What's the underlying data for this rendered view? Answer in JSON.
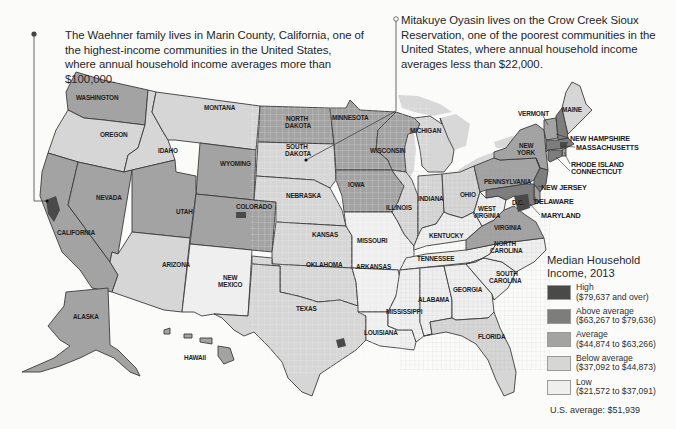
{
  "callouts": {
    "left": {
      "text": "The Waehner family lives in Marin County, California, one of the highest-income communities in the United States, where annual household income averages more than $100,000.",
      "marker": "filled-dot",
      "location": "Marin County, California"
    },
    "right": {
      "text": "Mitakuye Oyasin lives on the Crow Creek Sioux Reservation, one of the poorest communities in the United States, where annual household income averages less than $22,000.",
      "marker": "hollow-dot",
      "location": "Crow Creek Sioux Reservation, South Dakota"
    }
  },
  "legend": {
    "title": "Median Household Income, 2013",
    "items": [
      {
        "level": "high",
        "label": "High",
        "range": "($79,637 and over)",
        "color": "#4a4a4a"
      },
      {
        "level": "above",
        "label": "Above average",
        "range": "($63,267 to $79,636)",
        "color": "#7d7d7d"
      },
      {
        "level": "average",
        "label": "Average",
        "range": "($44,874 to $63,266)",
        "color": "#a3a3a3"
      },
      {
        "level": "below",
        "label": "Below average",
        "range": "($37,092 to $44,873)",
        "color": "#d6d6d6"
      },
      {
        "level": "low",
        "label": "Low",
        "range": "($21,572 to $37,091)",
        "color": "#efefef"
      }
    ],
    "us_average": "U.S. average: $51,939"
  },
  "map": {
    "title": "Median Household Income, 2013",
    "border_color": "#3a3a3a",
    "water_color": "#d9d9d9",
    "states": [
      {
        "name": "WASHINGTON",
        "level": "average"
      },
      {
        "name": "OREGON",
        "level": "below"
      },
      {
        "name": "CALIFORNIA",
        "level": "average"
      },
      {
        "name": "IDAHO",
        "level": "below"
      },
      {
        "name": "NEVADA",
        "level": "average"
      },
      {
        "name": "MONTANA",
        "level": "below"
      },
      {
        "name": "WYOMING",
        "level": "average"
      },
      {
        "name": "UTAH",
        "level": "average"
      },
      {
        "name": "ARIZONA",
        "level": "below"
      },
      {
        "name": "COLORADO",
        "level": "average"
      },
      {
        "name": "NEW MEXICO",
        "level": "low"
      },
      {
        "name": "NORTH DAKOTA",
        "level": "average"
      },
      {
        "name": "SOUTH DAKOTA",
        "level": "below"
      },
      {
        "name": "NEBRASKA",
        "level": "below"
      },
      {
        "name": "KANSAS",
        "level": "below"
      },
      {
        "name": "OKLAHOMA",
        "level": "below"
      },
      {
        "name": "TEXAS",
        "level": "below"
      },
      {
        "name": "MINNESOTA",
        "level": "average"
      },
      {
        "name": "IOWA",
        "level": "average"
      },
      {
        "name": "MISSOURI",
        "level": "low"
      },
      {
        "name": "ARKANSAS",
        "level": "low"
      },
      {
        "name": "LOUISIANA",
        "level": "low"
      },
      {
        "name": "WISCONSIN",
        "level": "average"
      },
      {
        "name": "ILLINOIS",
        "level": "below"
      },
      {
        "name": "MICHIGAN",
        "level": "below"
      },
      {
        "name": "INDIANA",
        "level": "below"
      },
      {
        "name": "OHIO",
        "level": "below"
      },
      {
        "name": "KENTUCKY",
        "level": "low"
      },
      {
        "name": "TENNESSEE",
        "level": "low"
      },
      {
        "name": "MISSISSIPPI",
        "level": "low"
      },
      {
        "name": "ALABAMA",
        "level": "low"
      },
      {
        "name": "GEORGIA",
        "level": "low"
      },
      {
        "name": "FLORIDA",
        "level": "below"
      },
      {
        "name": "SOUTH CAROLINA",
        "level": "low"
      },
      {
        "name": "NORTH CAROLINA",
        "level": "low"
      },
      {
        "name": "VIRGINIA",
        "level": "average"
      },
      {
        "name": "WEST VIRGINIA",
        "level": "low"
      },
      {
        "name": "PENNSYLVANIA",
        "level": "average"
      },
      {
        "name": "NEW YORK",
        "level": "average"
      },
      {
        "name": "VERMONT",
        "level": "average"
      },
      {
        "name": "MAINE",
        "level": "below"
      },
      {
        "name": "NEW HAMPSHIRE",
        "level": "above"
      },
      {
        "name": "MASSACHUSETTS",
        "level": "above"
      },
      {
        "name": "RHODE ISLAND",
        "level": "average"
      },
      {
        "name": "CONNECTICUT",
        "level": "above"
      },
      {
        "name": "NEW JERSEY",
        "level": "above"
      },
      {
        "name": "DELAWARE",
        "level": "average"
      },
      {
        "name": "MARYLAND",
        "level": "above"
      },
      {
        "name": "ALASKA",
        "level": "average"
      },
      {
        "name": "HAWAII",
        "level": "average"
      }
    ],
    "labels": {
      "WASHINGTON": "WASHINGTON",
      "OREGON": "OREGON",
      "CALIFORNIA": "CALIFORNIA",
      "IDAHO": "IDAHO",
      "NEVADA": "NEVADA",
      "MONTANA": "MONTANA",
      "WYOMING": "WYOMING",
      "UTAH": "UTAH",
      "ARIZONA": "ARIZONA",
      "COLORADO": "COLORADO",
      "NEW_MEXICO_1": "NEW",
      "NEW_MEXICO_2": "MEXICO",
      "NORTH_DAKOTA_1": "NORTH",
      "NORTH_DAKOTA_2": "DAKOTA",
      "SOUTH_DAKOTA_1": "SOUTH",
      "SOUTH_DAKOTA_2": "DAKOTA",
      "NEBRASKA": "NEBRASKA",
      "KANSAS": "KANSAS",
      "OKLAHOMA": "OKLAHOMA",
      "TEXAS": "TEXAS",
      "MINNESOTA": "MINNESOTA",
      "IOWA": "IOWA",
      "MISSOURI": "MISSOURI",
      "ARKANSAS": "ARKANSAS",
      "LOUISIANA": "LOUISIANA",
      "WISCONSIN": "WISCONSIN",
      "ILLINOIS": "ILLINOIS",
      "MICHIGAN": "MICHIGAN",
      "INDIANA": "INDIANA",
      "OHIO": "OHIO",
      "KENTUCKY": "KENTUCKY",
      "TENNESSEE": "TENNESSEE",
      "MISSISSIPPI": "MISSISSIPPI",
      "ALABAMA": "ALABAMA",
      "GEORGIA": "GEORGIA",
      "FLORIDA": "FLORIDA",
      "SOUTH_CAROLINA_1": "SOUTH",
      "SOUTH_CAROLINA_2": "CAROLINA",
      "NORTH_CAROLINA_1": "NORTH",
      "NORTH_CAROLINA_2": "CAROLINA",
      "VIRGINIA": "VIRGINIA",
      "WEST_VIRGINIA_1": "WEST",
      "WEST_VIRGINIA_2": "VIRGINIA",
      "PENNSYLVANIA": "PENNSYLVANIA",
      "NEW_YORK_1": "NEW",
      "NEW_YORK_2": "YORK",
      "VERMONT": "VERMONT",
      "MAINE": "MAINE",
      "NEW_HAMPSHIRE": "NEW HAMPSHIRE",
      "MASSACHUSETTS": "MASSACHUSETTS",
      "RHODE_ISLAND": "RHODE ISLAND",
      "CONNECTICUT": "CONNECTICUT",
      "NEW_JERSEY": "NEW JERSEY",
      "DELAWARE": "DELAWARE",
      "MARYLAND": "MARYLAND",
      "DC": "D.C.",
      "ALASKA": "ALASKA",
      "HAWAII": "HAWAII"
    }
  }
}
